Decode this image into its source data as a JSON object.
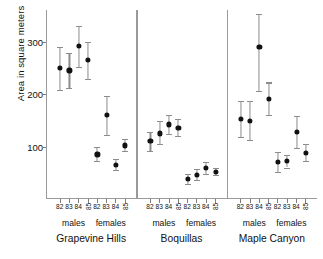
{
  "chart_data": {
    "type": "scatter",
    "title": "",
    "xlabel": "",
    "ylabel": "Area in square meters",
    "ylim": [
      0,
      360
    ],
    "yticks": [
      100,
      200,
      300
    ],
    "ytick_labels": [
      "100",
      "200",
      "300"
    ],
    "grid": false,
    "legend": false,
    "error_bars": "vertical",
    "panels": [
      {
        "name": "Grapevine Hills",
        "groups": [
          {
            "name": "males",
            "x_labels": [
              "82",
              "83",
              "84",
              "85"
            ],
            "rotated_label_index": 3,
            "values": [
              250,
              245,
              292,
              265
            ],
            "lower": [
              208,
              212,
              252,
              228
            ],
            "upper": [
              290,
              278,
              330,
              300
            ]
          },
          {
            "name": "females",
            "x_labels": [
              "82",
              "83",
              "84",
              "85"
            ],
            "rotated_label_index": 3,
            "values": [
              85,
              160,
              65,
              102
            ],
            "lower": [
              72,
              122,
              56,
              92
            ],
            "upper": [
              99,
              196,
              76,
              114
            ]
          }
        ]
      },
      {
        "name": "Boquillas",
        "groups": [
          {
            "name": "males",
            "x_labels": [
              "82",
              "83",
              "84",
              "85"
            ],
            "rotated_label_index": 3,
            "values": [
              110,
              125,
              142,
              136
            ],
            "lower": [
              92,
              104,
              124,
              120
            ],
            "upper": [
              128,
              148,
              160,
              152
            ]
          },
          {
            "name": "females",
            "x_labels": [
              "82",
              "83",
              "84",
              "85"
            ],
            "rotated_label_index": 3,
            "values": [
              38,
              46,
              59,
              52
            ],
            "lower": [
              28,
              36,
              48,
              45
            ],
            "upper": [
              48,
              57,
              70,
              60
            ]
          }
        ]
      },
      {
        "name": "Maple Canyon",
        "groups": [
          {
            "name": "males",
            "x_labels": [
              "82",
              "83",
              "84",
              "85"
            ],
            "rotated_label_index": 3,
            "values": [
              152,
              148,
              290,
              190
            ],
            "lower": [
              118,
              112,
              205,
              160
            ],
            "upper": [
              186,
              186,
              352,
              222
            ]
          },
          {
            "name": "females",
            "x_labels": [
              "82",
              "83",
              "84",
              "85"
            ],
            "rotated_label_index": 3,
            "values": [
              70,
              72,
              128,
              88
            ],
            "lower": [
              52,
              60,
              98,
              72
            ],
            "upper": [
              90,
              84,
              158,
              104
            ]
          }
        ]
      }
    ]
  },
  "axis": {
    "y_title": "Area in square meters"
  }
}
